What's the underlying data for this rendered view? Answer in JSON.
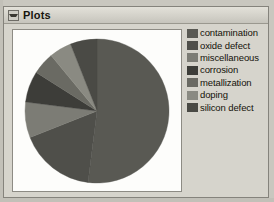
{
  "window": {
    "title": "Plots",
    "collapse_icon": "triangle-down-icon"
  },
  "legend": {
    "items": [
      {
        "label": "contamination",
        "color": "#595953"
      },
      {
        "label": "oxide defect",
        "color": "#4f4f4a"
      },
      {
        "label": "miscellaneous",
        "color": "#7c7c75"
      },
      {
        "label": "corrosion",
        "color": "#3d3d39"
      },
      {
        "label": "metallization",
        "color": "#6a6a63"
      },
      {
        "label": "doping",
        "color": "#8a8a82"
      },
      {
        "label": "silicon defect",
        "color": "#4a4a45"
      }
    ]
  },
  "chart_data": {
    "type": "pie",
    "title": "",
    "labels": [
      "contamination",
      "oxide defect",
      "miscellaneous",
      "corrosion",
      "metallization",
      "doping",
      "silicon defect"
    ],
    "values": [
      52,
      17,
      8,
      7,
      5,
      5,
      6
    ],
    "colors": [
      "#595953",
      "#4f4f4a",
      "#7c7c75",
      "#3d3d39",
      "#6a6a63",
      "#8a8a82",
      "#4a4a45"
    ],
    "start_angle": 0,
    "direction": "clockwise",
    "legend_position": "right",
    "grid": false
  }
}
